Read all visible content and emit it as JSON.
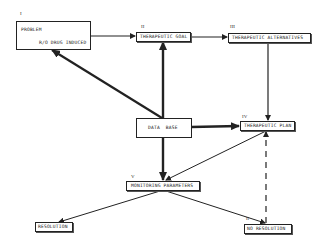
{
  "diagram": {
    "nodes": {
      "problem": {
        "numeral": "I",
        "title": "PROBLEM",
        "subtitle": "R/O DRUG INDUCED"
      },
      "therapeutic_goal": {
        "numeral": "II",
        "label": "THERAPEUTIC GOAL"
      },
      "therapeutic_alternatives": {
        "numeral": "III",
        "label": "THERAPEUTIC ALTERNATIVES"
      },
      "data_base": {
        "label": "DATA BASE"
      },
      "therapeutic_plan": {
        "numeral": "IV",
        "label": "THERAPEUTIC PLAN"
      },
      "monitoring_parameters": {
        "numeral": "V",
        "label": "MONITORING PARAMETERS"
      },
      "resolution": {
        "label": "RESOLUTION"
      },
      "no_resolution": {
        "numeral": "II",
        "label": "NO RESOLUTION"
      }
    },
    "edges": [
      {
        "from": "problem",
        "to": "therapeutic_goal",
        "style": "solid"
      },
      {
        "from": "therapeutic_goal",
        "to": "therapeutic_alternatives",
        "style": "solid"
      },
      {
        "from": "therapeutic_alternatives",
        "to": "therapeutic_plan",
        "style": "solid"
      },
      {
        "from": "data_base",
        "to": "problem",
        "style": "bold"
      },
      {
        "from": "data_base",
        "to": "therapeutic_goal",
        "style": "bold"
      },
      {
        "from": "data_base",
        "to": "therapeutic_plan",
        "style": "bold"
      },
      {
        "from": "data_base",
        "to": "monitoring_parameters",
        "style": "bold"
      },
      {
        "from": "therapeutic_plan",
        "to": "monitoring_parameters",
        "style": "solid"
      },
      {
        "from": "monitoring_parameters",
        "to": "resolution",
        "style": "solid"
      },
      {
        "from": "monitoring_parameters",
        "to": "no_resolution",
        "style": "solid"
      },
      {
        "from": "no_resolution",
        "to": "therapeutic_plan",
        "style": "dashed"
      }
    ]
  }
}
